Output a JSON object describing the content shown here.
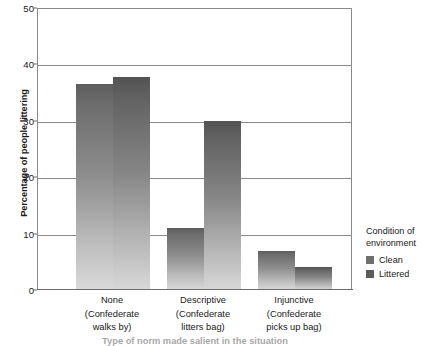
{
  "chart_data": {
    "type": "bar",
    "title": "",
    "xlabel": "Type of norm made salient in the situation",
    "ylabel": "Percentage of people littering",
    "ylim": [
      0,
      50
    ],
    "yticks": [
      0,
      10,
      20,
      30,
      40,
      50
    ],
    "ytick_labels": [
      "0",
      "10",
      "20",
      "30",
      "40",
      "50"
    ],
    "grid": true,
    "grid_axis": "y",
    "legend_position": "right",
    "legend_title": "Condition of environment",
    "categories": [
      "None",
      "Descriptive",
      "Injunctive"
    ],
    "category_sublabels": [
      "(Confederate walks by)",
      "(Confederate litters bag)",
      "(Confederate picks up bag)"
    ],
    "series": [
      {
        "name": "Clean",
        "color": "#6e6e6e",
        "values": [
          36.5,
          11.0,
          7.0
        ]
      },
      {
        "name": "Littered",
        "color": "#5a5a5a",
        "values": [
          37.8,
          30.0,
          4.0
        ]
      }
    ]
  },
  "axes": {
    "y_title": "Percentage of people littering",
    "y_ticks": [
      {
        "label": "50",
        "value": 50
      },
      {
        "label": "40",
        "value": 40
      },
      {
        "label": "30",
        "value": 30
      },
      {
        "label": "20",
        "value": 20
      },
      {
        "label": "10",
        "value": 10
      },
      {
        "label": "0",
        "value": 0
      }
    ]
  },
  "groups": [
    {
      "main": "None",
      "sub_line1": "(Confederate",
      "sub_line2": "walks by)",
      "bars": [
        {
          "series": "Clean",
          "value": 36.5
        },
        {
          "series": "Littered",
          "value": 37.8
        }
      ]
    },
    {
      "main": "Descriptive",
      "sub_line1": "(Confederate",
      "sub_line2": "litters bag)",
      "bars": [
        {
          "series": "Clean",
          "value": 11.0
        },
        {
          "series": "Littered",
          "value": 30.0
        }
      ]
    },
    {
      "main": "Injunctive",
      "sub_line1": "(Confederate",
      "sub_line2": "picks up bag)",
      "bars": [
        {
          "series": "Clean",
          "value": 7.0
        },
        {
          "series": "Littered",
          "value": 4.0
        }
      ]
    }
  ],
  "legend": {
    "title_line1": "Condition of",
    "title_line2": "environment",
    "items": [
      {
        "label": "Clean",
        "color": "#6e6e6e"
      },
      {
        "label": "Littered",
        "color": "#5a5a5a"
      }
    ]
  },
  "caption": {
    "text": "Type of norm made salient in the situation"
  },
  "colors": {
    "clean": "#6e6e6e",
    "littered": "#5a5a5a",
    "gridline": "#8a8a8a",
    "axis": "#6b6b6b",
    "text": "#1a1a1a",
    "background": "#ffffff"
  }
}
